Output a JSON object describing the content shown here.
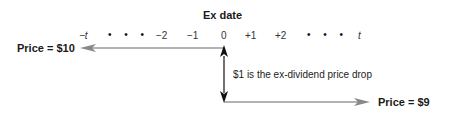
{
  "diagram": {
    "title": "Ex date",
    "timeline": {
      "ticks": [
        {
          "label": "−t",
          "italic": true
        },
        {
          "label": "• • •",
          "dots": true
        },
        {
          "label": "−2"
        },
        {
          "label": "−1"
        },
        {
          "label": "0"
        },
        {
          "label": "+1"
        },
        {
          "label": "+2"
        },
        {
          "label": "• • •",
          "dots": true
        },
        {
          "label": "t",
          "italic": true
        }
      ]
    },
    "price_before": "Price = $10",
    "price_after": "Price = $9",
    "drop_note": "$1 is the ex-dividend price drop",
    "colors": {
      "line": "#555555",
      "arrow_head_gray": "#888888",
      "arrow_head_black": "#111111",
      "text": "#1a1a1a"
    }
  }
}
